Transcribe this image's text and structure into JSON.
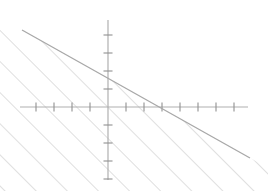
{
  "chart_data": {
    "type": "line",
    "title": "",
    "xlabel": "",
    "ylabel": "",
    "axes": {
      "x_axis": {
        "origin_px": 108,
        "y_px": 107,
        "start_px": 20,
        "end_px": 248,
        "tick_spacing_px": 18,
        "tick_length_px": 9,
        "ticks_left_of_origin": 5,
        "ticks_right_of_origin": 7,
        "grid": false
      },
      "y_axis": {
        "origin_px": 107,
        "x_px": 108,
        "start_px": 20,
        "end_px": 180,
        "tick_spacing_px": 18,
        "tick_length_px": 9,
        "ticks_above_origin": 5,
        "ticks_below_origin": 4,
        "grid": false
      },
      "xlim": [
        -5,
        8
      ],
      "ylim": [
        -4,
        5
      ]
    },
    "series": [
      {
        "name": "boundary-line",
        "type": "line",
        "style": "solid",
        "x": [
          -4.8,
          7.8
        ],
        "y": [
          4.3,
          -2.8
        ],
        "slope": -0.5625,
        "y_intercept": 1.72,
        "x_intercept": 3.06,
        "px_start": [
          22,
          30
        ],
        "px_end": [
          250,
          158
        ]
      }
    ],
    "shaded_region": {
      "name": "below-line-half-plane",
      "relation": "less-than-or-equal",
      "fill": "diagonal-hatch",
      "hatch_angle_deg": 45,
      "hatch_spacing_px": 22
    },
    "colors": {
      "axis": "#b0b0b0",
      "tick": "#909090",
      "line": "#a8a8a8",
      "hatch": "#c4c4c4",
      "background": "#ffffff"
    },
    "legend": {
      "visible": false,
      "entries": []
    },
    "annotations": [],
    "tick_labels": {
      "x": [],
      "y": []
    }
  }
}
